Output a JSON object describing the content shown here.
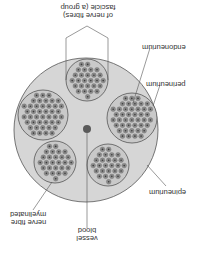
{
  "diagram": {
    "orientation": "rotated 180 degrees",
    "colors": {
      "background": "#ffffff",
      "epineurium_fill": "#d6d6d6",
      "outline": "#555555",
      "fascicle_fill": "#c9c9c9",
      "fibre_ring": "#8a8a8a",
      "fibre_core": "#3a3a3a",
      "blood_vessel": "#5a5a5a",
      "label_text": "#333333"
    },
    "labels": {
      "fascicle": [
        "fascicle (a group",
        "of nerve fibres)"
      ],
      "endoneurium": "endoneurium",
      "perineurium": "perineurium",
      "epineurium": "epineurium",
      "blood_vessel": [
        "blood",
        "vessel"
      ],
      "myelinated_fibre": [
        "myelinated",
        "nerve fibre"
      ]
    },
    "nerve": {
      "cx": 86,
      "cy": 130,
      "r": 72
    },
    "blood_vessel_dot": {
      "cx": 87,
      "cy": 129,
      "r": 4
    },
    "fascicles": [
      {
        "name": "top",
        "cx": 87,
        "cy": 80,
        "r": 21
      },
      {
        "name": "right",
        "cx": 132,
        "cy": 118,
        "r": 25
      },
      {
        "name": "left",
        "cx": 43,
        "cy": 115,
        "r": 25
      },
      {
        "name": "bottom-left",
        "cx": 55,
        "cy": 162,
        "r": 21
      },
      {
        "name": "bottom-right",
        "cx": 108,
        "cy": 165,
        "r": 21
      }
    ]
  }
}
